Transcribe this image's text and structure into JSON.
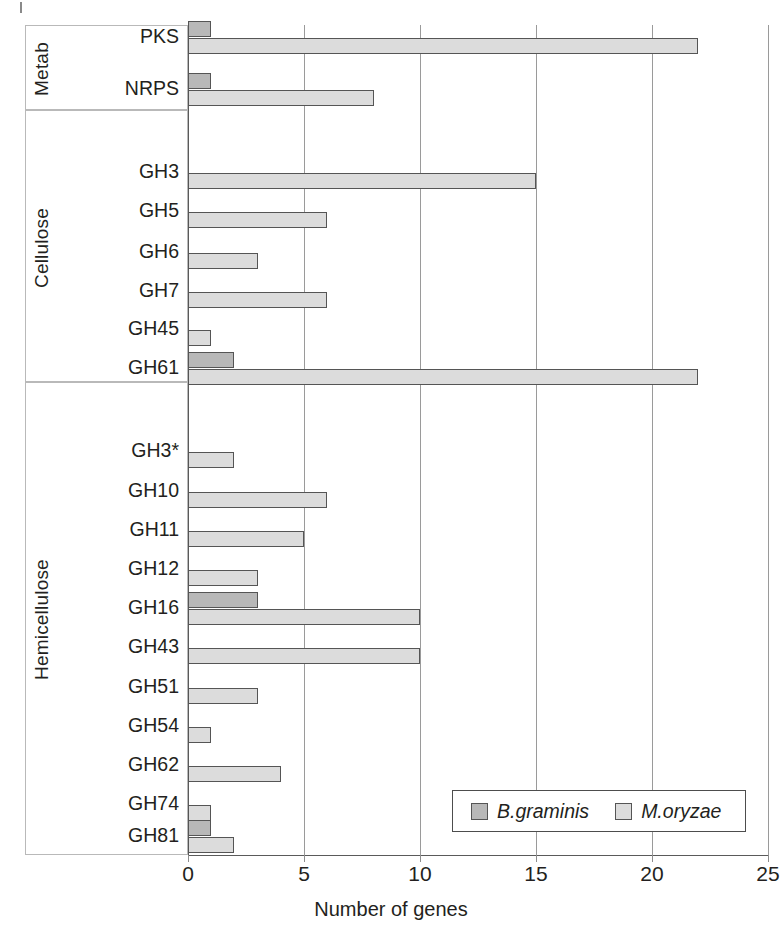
{
  "chart_data": {
    "type": "bar",
    "orientation": "horizontal",
    "title": "",
    "xlabel": "Number of genes",
    "ylabel": "",
    "xlim": [
      0,
      25
    ],
    "xticks": [
      0,
      5,
      10,
      15,
      20,
      25
    ],
    "grid": true,
    "legend_position": "bottom-right",
    "categories": [
      "PKS",
      "NRPS",
      "GH3",
      "GH5",
      "GH6",
      "GH7",
      "GH45",
      "GH61",
      "GH3*",
      "GH10",
      "GH11",
      "GH12",
      "GH16",
      "GH43",
      "GH51",
      "GH54",
      "GH62",
      "GH74",
      "GH81"
    ],
    "series": [
      {
        "name": "B.graminis",
        "color": "#b8b8b8",
        "values": [
          1,
          1,
          0,
          0,
          0,
          0,
          0,
          2,
          0,
          0,
          0,
          0,
          3,
          0,
          0,
          0,
          0,
          0,
          1
        ]
      },
      {
        "name": "M.oryzae",
        "color": "#dcdcdc",
        "values": [
          22,
          8,
          15,
          6,
          3,
          6,
          1,
          22,
          2,
          6,
          5,
          3,
          10,
          10,
          3,
          1,
          4,
          1,
          2
        ]
      }
    ],
    "groups": [
      {
        "label": "Metab",
        "categories": [
          "PKS",
          "NRPS"
        ]
      },
      {
        "label": "Cellulose",
        "categories": [
          "GH3",
          "GH5",
          "GH6",
          "GH7",
          "GH45",
          "GH61"
        ]
      },
      {
        "label": "Hemicellulose",
        "categories": [
          "GH3*",
          "GH10",
          "GH11",
          "GH12",
          "GH16",
          "GH43",
          "GH51",
          "GH54",
          "GH62",
          "GH74",
          "GH81"
        ]
      }
    ]
  },
  "axis": {
    "x_label": "Number of genes",
    "ticks": [
      "0",
      "5",
      "10",
      "15",
      "20",
      "25"
    ]
  },
  "legend": {
    "items": [
      {
        "label": "B.graminis",
        "swatch": "series-0-swatch"
      },
      {
        "label": "M.oryzae",
        "swatch": "series-1-swatch"
      }
    ]
  },
  "groups": [
    {
      "label": "Metab"
    },
    {
      "label": "Cellulose"
    },
    {
      "label": "Hemicellulose"
    }
  ],
  "rows": [
    {
      "label": "PKS"
    },
    {
      "label": "NRPS"
    },
    {
      "label": "GH3"
    },
    {
      "label": "GH5"
    },
    {
      "label": "GH6"
    },
    {
      "label": "GH7"
    },
    {
      "label": "GH45"
    },
    {
      "label": "GH61"
    },
    {
      "label": "GH3*"
    },
    {
      "label": "GH10"
    },
    {
      "label": "GH11"
    },
    {
      "label": "GH12"
    },
    {
      "label": "GH16"
    },
    {
      "label": "GH43"
    },
    {
      "label": "GH51"
    },
    {
      "label": "GH54"
    },
    {
      "label": "GH62"
    },
    {
      "label": "GH74"
    },
    {
      "label": "GH81"
    }
  ]
}
